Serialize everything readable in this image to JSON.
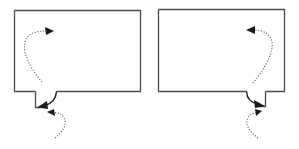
{
  "diagram": {
    "colors": {
      "outline": "#4a4a4a",
      "arrow": "#1a1a1a",
      "dotted": "#6a6a6a",
      "background": "#ffffff"
    },
    "figures": [
      {
        "id": "left",
        "notch_side": "left",
        "inner_arrow_direction": "up-then-right",
        "outer_arrow_direction": "up-left"
      },
      {
        "id": "right",
        "notch_side": "right",
        "inner_arrow_direction": "up-then-left",
        "outer_arrow_direction": "up-right"
      }
    ]
  }
}
